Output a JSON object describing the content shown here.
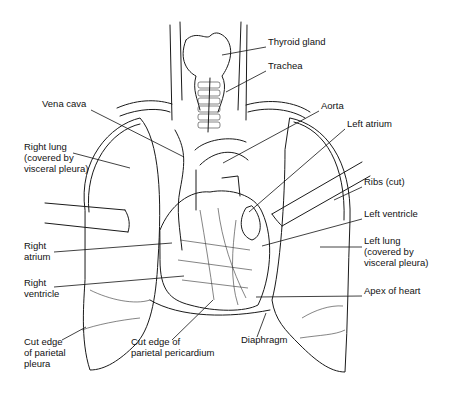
{
  "figure": {
    "labels": [
      {
        "id": "thyroid-gland",
        "text": "Thyroid gland",
        "x": 268,
        "y": 42,
        "lx1": 222,
        "ly1": 55,
        "lx2": 266,
        "ly2": 47
      },
      {
        "id": "trachea",
        "text": "Trachea",
        "x": 268,
        "y": 66,
        "lx1": 226,
        "ly1": 92,
        "lx2": 266,
        "ly2": 71
      },
      {
        "id": "vena-cava",
        "text": "Vena cava",
        "x": 42,
        "y": 104,
        "lx1": 91,
        "ly1": 110,
        "lx2": 184,
        "ly2": 157
      },
      {
        "id": "aorta",
        "text": "Aorta",
        "x": 321,
        "y": 106,
        "lx1": 319,
        "ly1": 111,
        "lx2": 223,
        "ly2": 163
      },
      {
        "id": "left-atrium",
        "text": "Left atrium",
        "x": 347,
        "y": 124,
        "lx1": 345,
        "ly1": 129,
        "lx2": 249,
        "ly2": 212
      },
      {
        "id": "right-lung",
        "text": "Right lung\n(covered by\nvisceral pleura)",
        "x": 24,
        "y": 147,
        "lx1": 73,
        "ly1": 153,
        "lx2": 130,
        "ly2": 168
      },
      {
        "id": "ribs-cut",
        "text": "Ribs (cut)",
        "x": 364,
        "y": 182,
        "lx1": 362,
        "ly1": 187,
        "lx2": 334,
        "ly2": 200
      },
      {
        "id": "left-ventricle",
        "text": "Left ventricle",
        "x": 364,
        "y": 214,
        "lx1": 362,
        "ly1": 219,
        "lx2": 262,
        "ly2": 246
      },
      {
        "id": "left-lung",
        "text": "Left lung\n(covered by\nvisceral pleura)",
        "x": 364,
        "y": 241,
        "lx1": 362,
        "ly1": 247,
        "lx2": 320,
        "ly2": 247
      },
      {
        "id": "right-atrium",
        "text": "Right\natrium",
        "x": 24,
        "y": 246,
        "lx1": 54,
        "ly1": 252,
        "lx2": 172,
        "ly2": 243
      },
      {
        "id": "right-ventricle",
        "text": "Right\nventricle",
        "x": 24,
        "y": 283,
        "lx1": 54,
        "ly1": 287,
        "lx2": 184,
        "ly2": 276
      },
      {
        "id": "apex-of-heart",
        "text": "Apex of heart",
        "x": 364,
        "y": 291,
        "lx1": 362,
        "ly1": 296,
        "lx2": 256,
        "ly2": 297
      },
      {
        "id": "cut-edge-parietal-pleura",
        "text": "Cut edge\nof parietal\npleura",
        "x": 24,
        "y": 342,
        "lx1": 62,
        "ly1": 340,
        "lx2": 86,
        "ly2": 327
      },
      {
        "id": "cut-edge-parietal-pericardium",
        "text": "Cut edge of\nparietal pericardium",
        "x": 131,
        "y": 342,
        "lx1": 172,
        "ly1": 340,
        "lx2": 213,
        "ly2": 300
      },
      {
        "id": "diaphragm",
        "text": "Diaphragm",
        "x": 241,
        "y": 340,
        "lx1": 257,
        "ly1": 337,
        "lx2": 266,
        "ly2": 313
      }
    ]
  }
}
